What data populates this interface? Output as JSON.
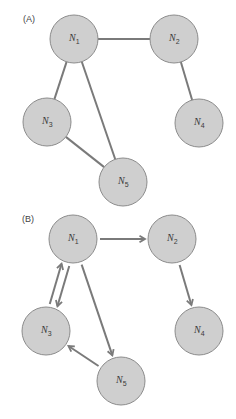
{
  "figure": {
    "colors": {
      "node_fill": "#cfcfcf",
      "node_stroke": "#8c8c8c",
      "edge": "#7a7a7a",
      "label": "#3a3a3a",
      "background": "#ffffff"
    },
    "node_radius": 24,
    "panels": [
      {
        "id": "A",
        "label": "(A)",
        "label_pos": [
          23,
          22
        ],
        "directed": false,
        "nodes": [
          {
            "id": "N1",
            "letter": "N",
            "sub": "1",
            "x": 74,
            "y": 39
          },
          {
            "id": "N2",
            "letter": "N",
            "sub": "2",
            "x": 174,
            "y": 39
          },
          {
            "id": "N3",
            "letter": "N",
            "sub": "3",
            "x": 47,
            "y": 122
          },
          {
            "id": "N4",
            "letter": "N",
            "sub": "4",
            "x": 199,
            "y": 123
          },
          {
            "id": "N5",
            "letter": "N",
            "sub": "5",
            "x": 123,
            "y": 182
          }
        ],
        "edges": [
          {
            "from": "N1",
            "to": "N2"
          },
          {
            "from": "N1",
            "to": "N3"
          },
          {
            "from": "N1",
            "to": "N5"
          },
          {
            "from": "N3",
            "to": "N5"
          },
          {
            "from": "N2",
            "to": "N4"
          }
        ]
      },
      {
        "id": "B",
        "label": "(B)",
        "label_pos": [
          22,
          222
        ],
        "directed": true,
        "nodes": [
          {
            "id": "N1",
            "letter": "N",
            "sub": "1",
            "x": 73,
            "y": 239
          },
          {
            "id": "N2",
            "letter": "N",
            "sub": "2",
            "x": 172,
            "y": 239
          },
          {
            "id": "N3",
            "letter": "N",
            "sub": "3",
            "x": 46,
            "y": 331
          },
          {
            "id": "N4",
            "letter": "N",
            "sub": "4",
            "x": 199,
            "y": 331
          },
          {
            "id": "N5",
            "letter": "N",
            "sub": "5",
            "x": 121,
            "y": 381
          }
        ],
        "edges": [
          {
            "from": "N1",
            "to": "N2",
            "offset": 0
          },
          {
            "from": "N2",
            "to": "N4",
            "offset": 0
          },
          {
            "from": "N1",
            "to": "N3",
            "offset": -4
          },
          {
            "from": "N3",
            "to": "N1",
            "offset": -4
          },
          {
            "from": "N1",
            "to": "N5",
            "offset": 0
          },
          {
            "from": "N5",
            "to": "N3",
            "offset": 0
          }
        ]
      }
    ]
  }
}
